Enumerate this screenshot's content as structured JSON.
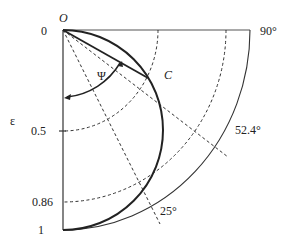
{
  "diagram": {
    "origin_label": "O",
    "point_label": "C",
    "angle_label": "Ψ",
    "axis_label": "ε",
    "axis_ticks": [
      "0",
      "0.5",
      "0.86",
      "1"
    ],
    "angle_labels": [
      "90°",
      "52.4°",
      "25°"
    ],
    "colors": {
      "line": "#333333",
      "background": "#ffffff"
    }
  }
}
